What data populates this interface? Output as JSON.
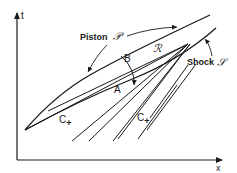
{
  "diagram": {
    "type": "x-t characteristic diagram",
    "axes": {
      "vertical_label": "t",
      "horizontal_label": "x"
    },
    "labels": {
      "piston": "Piston",
      "piston_symbol": "𝒫",
      "shock": "Shock",
      "shock_symbol": "𝒮",
      "region": "ℛ",
      "point_a": "A",
      "point_b": "B",
      "c_plus_left": "C",
      "c_plus_right": "C",
      "c_plus_sub": "+"
    },
    "colors": {
      "ink": "#1a1a1a",
      "background": "#ffffff"
    }
  }
}
